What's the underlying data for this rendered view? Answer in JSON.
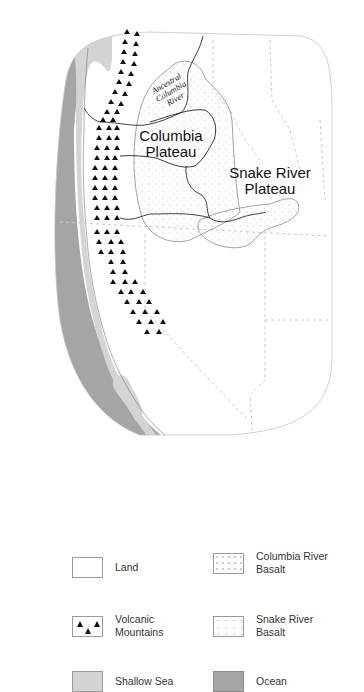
{
  "map": {
    "labels": {
      "columbia_plateau": "Columbia Plateau",
      "snake_river_plateau": "Snake River Plateau",
      "ancestral_columbia_river": "Ancestral Columbia River"
    },
    "colors": {
      "land": "#ffffff",
      "shallow_sea": "#d4d4d4",
      "ocean": "#a5a5a5",
      "river": "#2a2a2a",
      "border_dashed": "#c8c8c8",
      "basalt_outline": "#7a7a7a",
      "volcano": "#111111"
    }
  },
  "legend": {
    "items": [
      {
        "key": "land",
        "label": "Land"
      },
      {
        "key": "columbia_river_basalt",
        "label": "Columbia River Basalt"
      },
      {
        "key": "volcanic_mountains",
        "label": "Volcanic Mountains"
      },
      {
        "key": "snake_river_basalt",
        "label": "Snake River Basalt"
      },
      {
        "key": "shallow_sea",
        "label": "Shallow Sea"
      },
      {
        "key": "ocean",
        "label": "Ocean"
      }
    ]
  }
}
